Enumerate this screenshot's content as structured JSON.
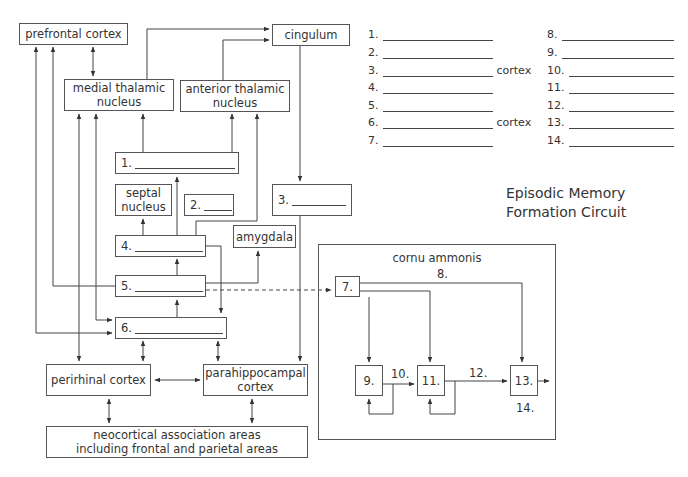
{
  "title": {
    "line1": "Episodic Memory",
    "line2": "Formation Circuit"
  },
  "boxes": {
    "prefrontal": "prefrontal cortex",
    "cingulum": "cingulum",
    "medial_thalamic_1": "medial thalamic",
    "medial_thalamic_2": "nucleus",
    "anterior_thalamic_1": "anterior thalamic",
    "anterior_thalamic_2": "nucleus",
    "b1": "1.",
    "septal_1": "septal",
    "septal_2": "nucleus",
    "b2": "2.",
    "b3": "3.",
    "b4": "4.",
    "amygdala": "amygdala",
    "b5": "5.",
    "b6": "6.",
    "perirhinal": "perirhinal cortex",
    "parahippocampal_1": "parahippocampal",
    "parahippocampal_2": "cortex",
    "neocortical_1": "neocortical association areas",
    "neocortical_2": "including frontal and parietal areas",
    "cornu_ammonis": "cornu ammonis",
    "b7": "7.",
    "b9": "9.",
    "b11": "11.",
    "b13": "13."
  },
  "edge_labels": {
    "l8": "8.",
    "l10": "10.",
    "l12": "12.",
    "l14": "14."
  },
  "answer_key": {
    "left": [
      {
        "num": "1.",
        "suffix": ""
      },
      {
        "num": "2.",
        "suffix": ""
      },
      {
        "num": "3.",
        "suffix": "cortex"
      },
      {
        "num": "4.",
        "suffix": ""
      },
      {
        "num": "5.",
        "suffix": ""
      },
      {
        "num": "6.",
        "suffix": "cortex"
      },
      {
        "num": "7.",
        "suffix": ""
      }
    ],
    "right": [
      {
        "num": "8.",
        "suffix": ""
      },
      {
        "num": "9.",
        "suffix": ""
      },
      {
        "num": "10.",
        "suffix": ""
      },
      {
        "num": "11.",
        "suffix": ""
      },
      {
        "num": "12.",
        "suffix": ""
      },
      {
        "num": "13.",
        "suffix": ""
      },
      {
        "num": "14.",
        "suffix": ""
      }
    ]
  },
  "colors": {
    "line": "#444444",
    "box_border": "#555555",
    "text": "#333333"
  }
}
